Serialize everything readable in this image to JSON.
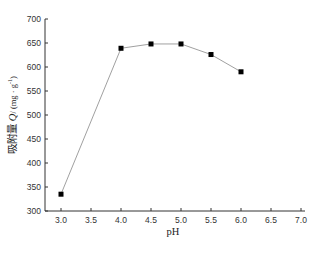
{
  "chart_data": {
    "type": "line",
    "title": "",
    "xlabel": "pH",
    "ylabel": "吸附量 Q/ (mg · g⁻¹)",
    "ylabel_parts": {
      "main": "吸附量 ",
      "var": "Q",
      "unit": "/ (mg · g",
      "sup": "-1",
      "close": ")"
    },
    "xlim": [
      3.0,
      7.0
    ],
    "ylim": [
      300,
      700
    ],
    "x_ticks": [
      "3.0",
      "3.5",
      "4.0",
      "4.5",
      "5.0",
      "5.5",
      "6.0",
      "6.5",
      "7.0"
    ],
    "y_ticks": [
      "300",
      "350",
      "400",
      "450",
      "500",
      "550",
      "600",
      "650",
      "700"
    ],
    "grid": false,
    "legend": null,
    "series": [
      {
        "name": "adsorption",
        "marker": "square",
        "color": "#000000",
        "line_color": "#888888",
        "x": [
          3.0,
          4.0,
          4.5,
          5.0,
          5.5,
          6.0
        ],
        "values": [
          335,
          639,
          648,
          648,
          626,
          590
        ]
      }
    ]
  }
}
